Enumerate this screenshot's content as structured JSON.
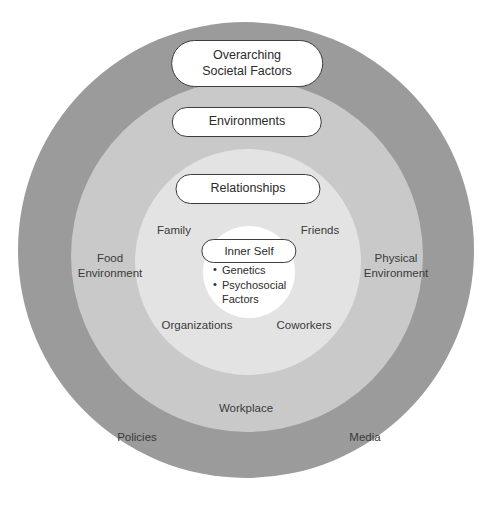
{
  "diagram": {
    "type": "concentric-circles",
    "rings": [
      {
        "id": "societal",
        "pill_lines": [
          "Overarching",
          "Societal Factors"
        ],
        "color": "#9b9b9b",
        "labels": [
          "Policies",
          "Media"
        ]
      },
      {
        "id": "environments",
        "pill_lines": [
          "Environments"
        ],
        "color": "#c9c9c9",
        "labels": [
          "Food Environment",
          "Physical Environment",
          "Workplace"
        ]
      },
      {
        "id": "relationships",
        "pill_lines": [
          "Relationships"
        ],
        "color": "#e3e3e3",
        "labels": [
          "Family",
          "Friends",
          "Organizations",
          "Coworkers"
        ]
      },
      {
        "id": "inner-self",
        "pill_lines": [
          "Inner Self"
        ],
        "color": "#ffffff",
        "bullets": [
          "Genetics",
          "Psychosocial Factors"
        ]
      }
    ],
    "pills": {
      "societal_line1": "Overarching",
      "societal_line2": "Societal Factors",
      "environments": "Environments",
      "relationships": "Relationships",
      "inner_self": "Inner Self"
    },
    "core_bullets": {
      "genetics": "Genetics",
      "psychosocial_line1": "Psychosocial",
      "psychosocial_line2": "Factors"
    },
    "labels": {
      "family": "Family",
      "friends": "Friends",
      "organizations": "Organizations",
      "coworkers": "Coworkers",
      "food_environment_line1": "Food",
      "food_environment_line2": "Environment",
      "physical_environment_line1": "Physical",
      "physical_environment_line2": "Environment",
      "workplace": "Workplace",
      "policies": "Policies",
      "media": "Media"
    }
  }
}
